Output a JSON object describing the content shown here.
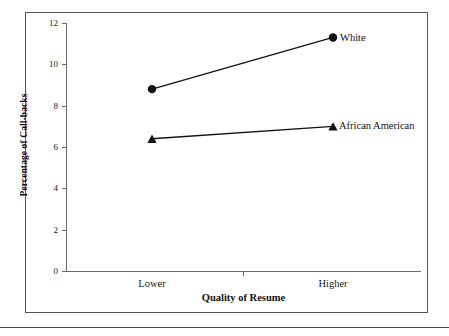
{
  "figure": {
    "has_outer_frame": true,
    "has_bottom_rule": true
  },
  "chart_data": {
    "type": "line",
    "title": "",
    "xlabel": "Quality of Resume",
    "ylabel": "Percentage of Call-backs",
    "categories": [
      "Lower",
      "Higher"
    ],
    "series": [
      {
        "name": "White",
        "marker": "circle",
        "values": [
          8.8,
          11.3
        ]
      },
      {
        "name": "African American",
        "marker": "triangle",
        "values": [
          6.4,
          7.0
        ]
      }
    ],
    "xlim": [
      0,
      1
    ],
    "ylim": [
      0,
      12
    ],
    "yticks": [
      0,
      2,
      4,
      6,
      8,
      10,
      12
    ],
    "ytick_labels": [
      "0",
      "2",
      "4",
      "6",
      "8",
      "10",
      "12"
    ],
    "xtick_labels": [
      "Lower",
      "Higher"
    ],
    "grid": false,
    "legend_position": "inline-right-of-last-point",
    "line_color": "#111111",
    "marker_color": "#111111"
  }
}
